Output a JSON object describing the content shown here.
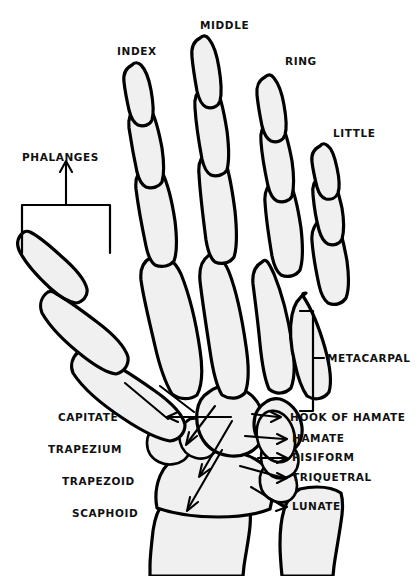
{
  "diagram": {
    "background_color": "#ffffff",
    "bone_fill_color": "#f0f0f0",
    "outline_color": "#000000",
    "label_color": "#111111"
  },
  "finger_labels": [
    {
      "id": "index",
      "text": "INDEX",
      "x": 117,
      "y": 46
    },
    {
      "id": "middle",
      "text": "MIDDLE",
      "x": 200,
      "y": 20
    },
    {
      "id": "ring",
      "text": "RING",
      "x": 285,
      "y": 56
    },
    {
      "id": "little",
      "text": "LITTLE",
      "x": 333,
      "y": 128
    }
  ],
  "group_labels": [
    {
      "id": "phalanges",
      "text": "PHALANGES",
      "x": 22,
      "y": 152
    },
    {
      "id": "metacarpal",
      "text": "METACARPAL",
      "x": 327,
      "y": 353
    }
  ],
  "carpal_labels_left": [
    {
      "id": "capitate",
      "text": "CAPITATE",
      "x": 118,
      "y": 414
    },
    {
      "id": "trapezium",
      "text": "TRAPEZIUM",
      "x": 130,
      "y": 447
    },
    {
      "id": "trapezoid",
      "text": "TRAPEZOID",
      "x": 140,
      "y": 478
    },
    {
      "id": "scaphoid",
      "text": "SCAPHOID",
      "x": 133,
      "y": 511
    }
  ],
  "carpal_labels_right": [
    {
      "id": "hook-of-hamate",
      "text": "HOOK OF HAMATE",
      "x": 284,
      "y": 420
    },
    {
      "id": "hamate",
      "text": "HAMATE",
      "x": 290,
      "y": 442
    },
    {
      "id": "pisiform",
      "text": "PISIFORM",
      "x": 290,
      "y": 461
    },
    {
      "id": "triquetral",
      "text": "TRIQUETRAL",
      "x": 290,
      "y": 481
    },
    {
      "id": "lunate",
      "text": "LUNATE",
      "x": 290,
      "y": 510
    }
  ],
  "bone_groups": {
    "phalanges_label": "phalanges",
    "metacarpals_label": "metacarpals",
    "carpals_label": "carpals",
    "forearm_label": "forearm bones"
  }
}
